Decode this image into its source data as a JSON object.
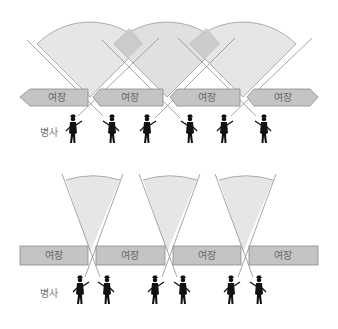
{
  "diagram": {
    "top": {
      "walls": [
        {
          "label": "여장"
        },
        {
          "label": "여장"
        },
        {
          "label": "여장"
        },
        {
          "label": "여장"
        }
      ],
      "soldier_label": "병사",
      "soldier_count": 6,
      "arrangement": "wide overlapping fields of fire"
    },
    "bottom": {
      "walls": [
        {
          "label": "여장"
        },
        {
          "label": "여장"
        },
        {
          "label": "여장"
        },
        {
          "label": "여장"
        }
      ],
      "soldier_label": "병사",
      "soldier_count": 6,
      "arrangement": "narrow fields of fire from paired soldiers"
    },
    "colors": {
      "sector_fill": "#e6e6e6",
      "sector_overlap": "#c9c9c9",
      "sector_edge": "#9a9a9a",
      "wall_fill": "#c4c4c4",
      "wall_edge": "#8a8a8a",
      "soldier": "#111111"
    }
  }
}
